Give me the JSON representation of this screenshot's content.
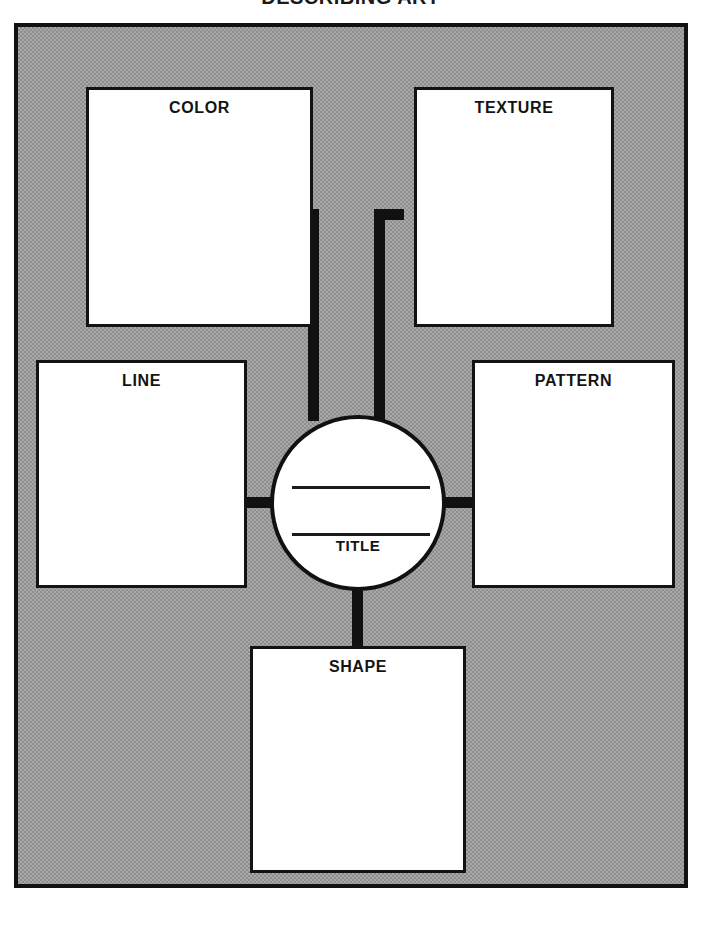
{
  "worksheet": {
    "title": "DESCRIBING ART",
    "center": {
      "label": "TITLE",
      "writing_lines": 2
    },
    "nodes": [
      {
        "id": "color",
        "label": "COLOR"
      },
      {
        "id": "texture",
        "label": "TEXTURE"
      },
      {
        "id": "line",
        "label": "LINE"
      },
      {
        "id": "pattern",
        "label": "PATTERN"
      },
      {
        "id": "shape",
        "label": "SHAPE"
      }
    ],
    "colors": {
      "stroke": "#111111",
      "box_fill": "#ffffff",
      "background_fill": "#a9a9a9",
      "text": "#141414"
    }
  }
}
